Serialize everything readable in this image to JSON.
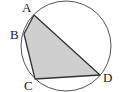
{
  "figure": {
    "type": "cyclic-quadrilateral",
    "circle": {
      "cx": 66,
      "cy": 46,
      "r": 45,
      "stroke": "#555555"
    },
    "quadrilateral": {
      "fill": "#cfcfcf",
      "stroke": "#333333",
      "vertices": [
        {
          "name": "A",
          "x": 34,
          "y": 15
        },
        {
          "name": "B",
          "x": 24,
          "y": 34
        },
        {
          "name": "C",
          "x": 35,
          "y": 79
        },
        {
          "name": "D",
          "x": 100,
          "y": 75
        }
      ]
    },
    "labels": {
      "A": "A",
      "B": "B",
      "C": "C",
      "D": "D"
    }
  }
}
